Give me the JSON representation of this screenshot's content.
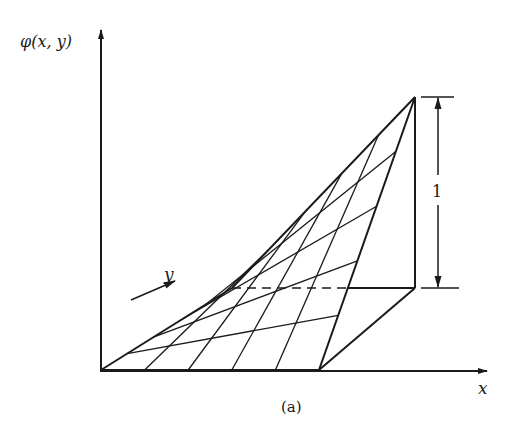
{
  "figure": {
    "caption": "(a)",
    "axes": {
      "vertical_label": "φ(x, y)",
      "horizontal_label": "x",
      "depth_label": "y"
    },
    "dimension": {
      "label": "1"
    },
    "grid_divisions": 5,
    "colors": {
      "ink": "#1a1a1a",
      "background": "#ffffff"
    },
    "points": {
      "origin": [
        101,
        370
      ],
      "x_end": [
        319,
        370
      ],
      "y_end": [
        232,
        288
      ],
      "peak": [
        415,
        97
      ],
      "peak_foot": [
        415,
        288
      ]
    }
  }
}
